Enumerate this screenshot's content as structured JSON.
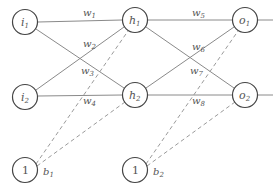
{
  "diagram": {
    "type": "neural-network",
    "layers": [
      "input",
      "hidden",
      "output"
    ],
    "nodes": [
      {
        "id": "i1",
        "base": "i",
        "sub": "1",
        "x": 25,
        "y": 22
      },
      {
        "id": "i2",
        "base": "i",
        "sub": "2",
        "x": 25,
        "y": 97
      },
      {
        "id": "h1",
        "base": "h",
        "sub": "1",
        "x": 135,
        "y": 20
      },
      {
        "id": "h2",
        "base": "h",
        "sub": "2",
        "x": 135,
        "y": 95
      },
      {
        "id": "o1",
        "base": "o",
        "sub": "1",
        "x": 245,
        "y": 20
      },
      {
        "id": "o2",
        "base": "o",
        "sub": "2",
        "x": 245,
        "y": 95
      },
      {
        "id": "bias1",
        "label": "1",
        "x": 25,
        "y": 170
      },
      {
        "id": "bias2",
        "label": "1",
        "x": 135,
        "y": 170
      }
    ],
    "weights": [
      {
        "base": "w",
        "sub": "1",
        "from": "i1",
        "to": "h1"
      },
      {
        "base": "w",
        "sub": "2",
        "from": "i2",
        "to": "h1"
      },
      {
        "base": "w",
        "sub": "3",
        "from": "i1",
        "to": "h2"
      },
      {
        "base": "w",
        "sub": "4",
        "from": "i2",
        "to": "h2"
      },
      {
        "base": "w",
        "sub": "5",
        "from": "h1",
        "to": "o1"
      },
      {
        "base": "w",
        "sub": "6",
        "from": "h2",
        "to": "o1"
      },
      {
        "base": "w",
        "sub": "7",
        "from": "h1",
        "to": "o2"
      },
      {
        "base": "w",
        "sub": "8",
        "from": "h2",
        "to": "o2"
      }
    ],
    "biases": [
      {
        "base": "b",
        "sub": "1",
        "from": "bias1",
        "to": [
          "h1",
          "h2"
        ]
      },
      {
        "base": "b",
        "sub": "2",
        "from": "bias2",
        "to": [
          "o1",
          "o2"
        ]
      }
    ],
    "colors": {
      "node_stroke": "#444444",
      "edge": "#8a8a8a",
      "text": "#555555",
      "background": "#ffffff"
    }
  }
}
